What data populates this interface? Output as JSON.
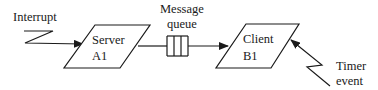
{
  "diagram": {
    "labels": {
      "interrupt": "Interrupt",
      "message_queue_line1": "Message",
      "message_queue_line2": "queue",
      "timer_line1": "Timer",
      "timer_line2": "event"
    },
    "nodes": {
      "server": {
        "line1": "Server",
        "line2": "A1"
      },
      "client": {
        "line1": "Client",
        "line2": "B1"
      }
    },
    "edges": [
      {
        "from": "interrupt",
        "to": "server"
      },
      {
        "from": "server",
        "to": "message-queue"
      },
      {
        "from": "message-queue",
        "to": "client"
      },
      {
        "from": "timer-event",
        "to": "client"
      }
    ],
    "colors": {
      "stroke": "#1a1a1a",
      "background": "#ffffff"
    }
  }
}
